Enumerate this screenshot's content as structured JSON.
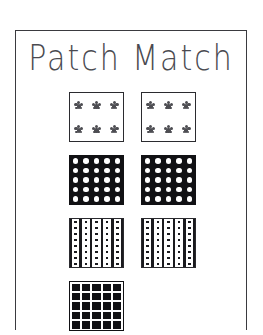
{
  "page": {
    "background_color": "#ffffff",
    "frame_color": "#3a3a3f"
  },
  "title": "Patch Match",
  "patches": {
    "columns": 2,
    "rows": [
      {
        "row_index": 1,
        "pattern_name": "floral-sprig",
        "pattern_label": "Floral sprigs on white",
        "fill_color": "#ffffff",
        "motif_color": "#4d4d52",
        "motif_columns": 3,
        "motif_rows": 2,
        "items": [
          {
            "position": "left",
            "name": "patch-floral-left"
          },
          {
            "position": "right",
            "name": "patch-floral-right"
          }
        ]
      },
      {
        "row_index": 2,
        "pattern_name": "polka-dot",
        "pattern_label": "White polka dots on black",
        "fill_color": "#111114",
        "motif_color": "#ffffff",
        "motif_columns": 5,
        "motif_rows": 5,
        "items": [
          {
            "position": "left",
            "name": "patch-polka-left"
          },
          {
            "position": "right",
            "name": "patch-polka-right"
          }
        ]
      },
      {
        "row_index": 3,
        "pattern_name": "stripe-dot",
        "pattern_label": "Vertical stripes with dotted columns",
        "fill_color": "#ffffff",
        "motif_color": "#1a1a1e",
        "stripe_count": 6,
        "dot_columns": 5,
        "dot_rows": 8,
        "items": [
          {
            "position": "left",
            "name": "patch-stripe-left"
          },
          {
            "position": "right",
            "name": "patch-stripe-right"
          }
        ]
      },
      {
        "row_index": 4,
        "pattern_name": "windowpane-grid",
        "pattern_label": "White grid lines on black",
        "fill_color": "#111114",
        "motif_color": "#ffffff",
        "grid_columns": 5,
        "grid_rows": 5,
        "clipped_at_bottom": true,
        "items": [
          {
            "position": "left",
            "name": "patch-grid-left"
          }
        ]
      }
    ]
  }
}
